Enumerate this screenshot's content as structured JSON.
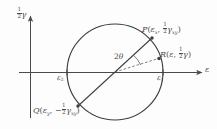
{
  "figure": {
    "name": "mohrs-circle-strain",
    "background": "#fdfdfd",
    "ink": "#4a4a4a"
  },
  "axes": {
    "vertical": {
      "label_prefix": "",
      "label_fraction_num": "1",
      "label_fraction_den": "2",
      "label_symbol": "γ",
      "label_plain": "½γ",
      "arrow": "up"
    },
    "horizontal": {
      "label_symbol": "ε",
      "label_plain": "ε",
      "arrow": "right"
    }
  },
  "circle": {
    "center_x": 115,
    "center_y": 72,
    "radius": 48
  },
  "points": [
    {
      "id": "P",
      "name": "point-p",
      "label_letter": "P",
      "coord_x_symbol": "ε",
      "coord_x_sub": "x",
      "coord_y_sign": "",
      "coord_y_num": "1",
      "coord_y_den": "2",
      "coord_y_symbol": "γ",
      "coord_y_sub": "xy",
      "label_plain": "P(εx, ½γxy)",
      "px": 152,
      "py": 38
    },
    {
      "id": "Q",
      "name": "point-q",
      "label_letter": "Q",
      "coord_x_symbol": "ε",
      "coord_x_sub": "y",
      "coord_y_sign": "−",
      "coord_y_num": "1",
      "coord_y_den": "2",
      "coord_y_symbol": "γ",
      "coord_y_sub": "xy",
      "label_plain": "Q(εy, −½γxy)",
      "px": 88,
      "py": 103
    },
    {
      "id": "R",
      "name": "point-r",
      "label_letter": "R",
      "coord_x_symbol": "ε",
      "coord_x_sub": "",
      "coord_y_sign": "",
      "coord_y_num": "1",
      "coord_y_den": "2",
      "coord_y_symbol": "γ",
      "coord_y_sub": "",
      "label_plain": "R(ε, ½γ)",
      "px": 157,
      "py": 58
    }
  ],
  "intercepts": [
    {
      "id": "e1",
      "name": "principal-strain-1",
      "symbol": "ε",
      "sub": "1",
      "label_plain": "ε1",
      "px": 163,
      "py": 72
    },
    {
      "id": "e2",
      "name": "principal-strain-2",
      "symbol": "ε",
      "sub": "2",
      "label_plain": "ε2",
      "px": 67,
      "py": 72
    }
  ],
  "angle": {
    "name": "angle-2theta",
    "value": "2",
    "symbol": "θ",
    "sub": "",
    "label_plain": "2θ"
  }
}
